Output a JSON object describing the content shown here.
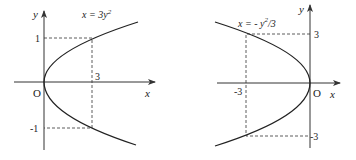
{
  "diagrams": [
    {
      "equation": "x = 3y²",
      "equation_main": "x = 3y",
      "equation_sup": "2",
      "axis_x_label": "x",
      "axis_y_label": "y",
      "origin_label": "O",
      "tick_labels": {
        "y_top": "1",
        "y_bottom": "-1",
        "x_mark": "3"
      },
      "marked_points": [
        [
          3,
          1
        ],
        [
          3,
          -1
        ]
      ],
      "opens": "right"
    },
    {
      "equation": "x = -y²/3",
      "equation_main": "x = - y",
      "equation_sup": "2",
      "equation_tail": "/3",
      "axis_x_label": "x",
      "axis_y_label": "y",
      "origin_label": "O",
      "tick_labels": {
        "y_top": "3",
        "y_bottom": "-3",
        "x_mark": "-3"
      },
      "marked_points": [
        [
          -3,
          3
        ],
        [
          -3,
          -3
        ]
      ],
      "opens": "left"
    }
  ]
}
